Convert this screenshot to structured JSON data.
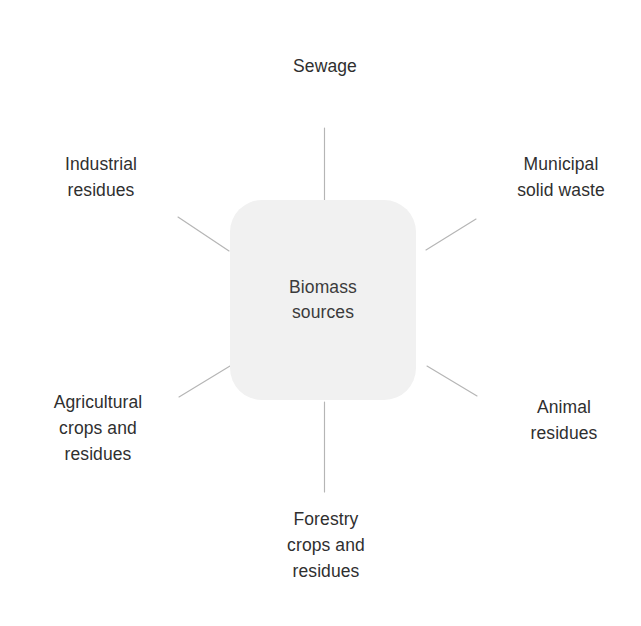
{
  "diagram": {
    "type": "radial-hub-and-spoke",
    "background_color": "#ffffff",
    "hub": {
      "label": "Biomass\nsources",
      "fill_color": "#f1f1f1",
      "text_color": "#3b3b3b"
    },
    "connector_color": "#b5b5b5",
    "nodes": [
      {
        "id": "sewage",
        "label": "Sewage",
        "position": "top"
      },
      {
        "id": "industrial-residues",
        "label": "Industrial\nresidues",
        "position": "top-left"
      },
      {
        "id": "municipal-solid-waste",
        "label": "Municipal\nsolid waste",
        "position": "top-right"
      },
      {
        "id": "agricultural-crops-and-residues",
        "label": "Agricultural\ncrops and\nresidues",
        "position": "bottom-left"
      },
      {
        "id": "animal-residues",
        "label": "Animal\nresidues",
        "position": "bottom-right"
      },
      {
        "id": "forestry-crops-and-residues",
        "label": "Forestry\ncrops and\nresidues",
        "position": "bottom"
      }
    ]
  }
}
